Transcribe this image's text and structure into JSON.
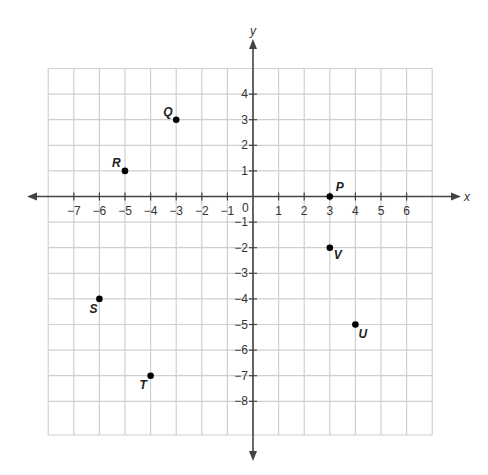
{
  "diagram": {
    "type": "coordinate-plane",
    "axes": {
      "x_label": "x",
      "y_label": "y",
      "origin_label": "0",
      "x_ticks": [
        -7,
        -6,
        -5,
        -4,
        -3,
        -2,
        -1,
        1,
        2,
        3,
        4,
        5,
        6
      ],
      "y_ticks": [
        4,
        3,
        2,
        1,
        -1,
        -2,
        -3,
        -4,
        -5,
        -6,
        -7,
        -8
      ]
    },
    "grid": {
      "x_min": -8,
      "x_max": 7,
      "y_min": -9.3,
      "y_max": 5
    },
    "points": [
      {
        "label": "P",
        "x": 3,
        "y": 0,
        "label_dx": 6,
        "label_dy": -6
      },
      {
        "label": "Q",
        "x": -3,
        "y": 3,
        "label_dx": -13,
        "label_dy": -4
      },
      {
        "label": "R",
        "x": -5,
        "y": 1,
        "label_dx": -13,
        "label_dy": -4
      },
      {
        "label": "S",
        "x": -6,
        "y": -4,
        "label_dx": -10,
        "label_dy": 14
      },
      {
        "label": "T",
        "x": -4,
        "y": -7,
        "label_dx": -11,
        "label_dy": 13
      },
      {
        "label": "U",
        "x": 4,
        "y": -5,
        "label_dx": 3,
        "label_dy": 13
      },
      {
        "label": "V",
        "x": 3,
        "y": -2,
        "label_dx": 4,
        "label_dy": 11
      }
    ]
  },
  "colors": {
    "grid": "#cfcfcf",
    "axis": "#444444",
    "point": "#000000"
  }
}
